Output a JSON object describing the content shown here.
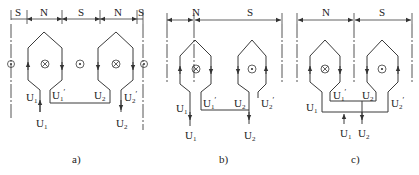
{
  "figure": {
    "panels": [
      {
        "id": "a",
        "caption": "a)",
        "poles": [
          "S",
          "N",
          "S",
          "N",
          "S"
        ],
        "coils": [
          {
            "current_symbol": "cross",
            "start_terminal": "U1",
            "end_terminal": "U1'"
          },
          {
            "current_symbol": "cross",
            "start_terminal": "U2",
            "end_terminal": "U2'"
          }
        ],
        "dot_symbols": 2,
        "external_terminals": [
          "U1",
          "U2"
        ],
        "connection": "series"
      },
      {
        "id": "b",
        "caption": "b)",
        "poles": [
          "N",
          "S"
        ],
        "coils": [
          {
            "current_symbol": "cross",
            "start_terminal": "U1",
            "end_terminal": "U1'"
          },
          {
            "current_symbol": "dot",
            "start_terminal": "U2",
            "end_terminal": "U2'"
          }
        ],
        "external_terminals": [
          "U1",
          "U2"
        ],
        "connection": "series"
      },
      {
        "id": "c",
        "caption": "c)",
        "poles": [
          "N",
          "S"
        ],
        "coils": [
          {
            "current_symbol": "cross",
            "start_terminal": "U1",
            "end_terminal": "U1'"
          },
          {
            "current_symbol": "dot",
            "start_terminal": "U2",
            "end_terminal": "U2'"
          }
        ],
        "external_terminals": [
          "U1",
          "U2"
        ],
        "connection": "parallel"
      }
    ],
    "labels": {
      "U": "U",
      "sub1": "1",
      "sub2": "2",
      "prime": "′",
      "S": "S",
      "N": "N",
      "cap_a": "a)",
      "cap_b": "b)",
      "cap_c": "c)"
    }
  }
}
